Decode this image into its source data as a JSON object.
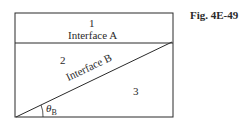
{
  "figure": {
    "label": "Fig. 4E-49"
  },
  "regions": [
    {
      "id": "region-1",
      "label": "1"
    },
    {
      "id": "region-2",
      "label": "2"
    },
    {
      "id": "region-3",
      "label": "3"
    }
  ],
  "interfaces": {
    "a": {
      "label": "Interface A"
    },
    "b": {
      "label": "Interface B"
    }
  },
  "angle": {
    "symbol": "θ",
    "subscript": "B"
  },
  "colors": {
    "line": "#2a2a2a",
    "background": "#ffffff"
  }
}
